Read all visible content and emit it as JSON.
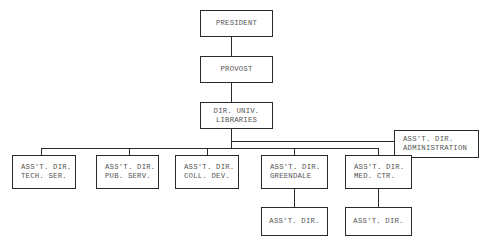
{
  "chart": {
    "nodes": {
      "president": {
        "line1": "PRESIDENT"
      },
      "provost": {
        "line1": "PROVOST"
      },
      "dir_univ_libraries": {
        "line1": "DIR. UNIV.",
        "line2": "LIBRARIES"
      },
      "asst_dir_administration": {
        "line1": "ASS'T. DIR.",
        "line2": "ADMINISTRATION"
      },
      "asst_dir_tech_ser": {
        "line1": "ASS'T. DIR.",
        "line2": "TECH. SER."
      },
      "asst_dir_pub_serv": {
        "line1": "ASS'T. DIR.",
        "line2": "PUB. SERV."
      },
      "asst_dir_coll_dev": {
        "line1": "ASS'T. DIR.",
        "line2": "COLL. DEV."
      },
      "asst_dir_greendale": {
        "line1": "ASS'T. DIR.",
        "line2": "GREENDALE"
      },
      "asst_dir_med_ctr": {
        "line1": "ASS'T. DIR.",
        "line2": "MED. CTR."
      },
      "asst_dir_under_greendale": {
        "line1": "ASS'T. DIR."
      },
      "asst_dir_under_med_ctr": {
        "line1": "ASS'T. DIR."
      }
    },
    "edges": [
      [
        "president",
        "provost"
      ],
      [
        "provost",
        "dir_univ_libraries"
      ],
      [
        "dir_univ_libraries",
        "asst_dir_administration"
      ],
      [
        "dir_univ_libraries",
        "asst_dir_tech_ser"
      ],
      [
        "dir_univ_libraries",
        "asst_dir_pub_serv"
      ],
      [
        "dir_univ_libraries",
        "asst_dir_coll_dev"
      ],
      [
        "dir_univ_libraries",
        "asst_dir_greendale"
      ],
      [
        "dir_univ_libraries",
        "asst_dir_med_ctr"
      ],
      [
        "asst_dir_greendale",
        "asst_dir_under_greendale"
      ],
      [
        "asst_dir_med_ctr",
        "asst_dir_under_med_ctr"
      ]
    ]
  }
}
